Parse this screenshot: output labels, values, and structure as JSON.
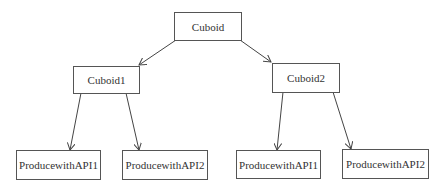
{
  "diagram": {
    "type": "tree",
    "nodes": [
      {
        "id": "root",
        "label": "Cuboid"
      },
      {
        "id": "c1",
        "label": "Cuboid1"
      },
      {
        "id": "c2",
        "label": "Cuboid2"
      },
      {
        "id": "c1a",
        "label": "ProducewithAPI1"
      },
      {
        "id": "c1b",
        "label": "ProducewithAPI2"
      },
      {
        "id": "c2a",
        "label": "ProducewithAPI1"
      },
      {
        "id": "c2b",
        "label": "ProducewithAPI2"
      }
    ],
    "edges": [
      {
        "from": "root",
        "to": "c1"
      },
      {
        "from": "root",
        "to": "c2"
      },
      {
        "from": "c1",
        "to": "c1a"
      },
      {
        "from": "c1",
        "to": "c1b"
      },
      {
        "from": "c2",
        "to": "c2a"
      },
      {
        "from": "c2",
        "to": "c2b"
      }
    ],
    "colors": {
      "line": "#444444",
      "border": "#555555",
      "text": "#333333",
      "background": "#ffffff"
    }
  }
}
